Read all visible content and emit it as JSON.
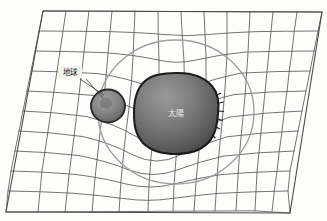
{
  "figure": {
    "background_color": "#fdfdfc",
    "labels": {
      "earth": "地球",
      "sun": "太陽"
    },
    "colors": {
      "grid_line": "#5a5a5a",
      "plane_edge": "#4a4a4a",
      "orbit_line": "#9a9a9a",
      "sun_fill": "#6f6f6f",
      "sun_outline": "#1c1c1c",
      "earth_fill": "#7d7d7d",
      "earth_outline": "#2a2a2a",
      "label_text": "#1d1d1d",
      "sun_label_text": "#efe9e2"
    },
    "grid": {
      "columns": 12,
      "rows": 10,
      "plane_corners": {
        "top_left": [
          43,
          11
        ],
        "top_right": [
          322,
          12
        ],
        "bottom_right": [
          290,
          213
        ],
        "bottom_left": [
          6,
          212
        ]
      }
    },
    "bodies": [
      {
        "name": "sun",
        "label": "太陽",
        "center": [
          176,
          113
        ],
        "radius_x": 42,
        "radius_y": 40
      },
      {
        "name": "earth",
        "label": "地球",
        "center": [
          108,
          106
        ],
        "radius_x": 17,
        "radius_y": 16
      }
    ],
    "orbit": {
      "name": "earth-orbit-ellipse",
      "center": [
        176,
        112
      ],
      "radius_x": 78,
      "radius_y": 72
    },
    "leader_line": {
      "from": [
        80,
        78
      ],
      "to": [
        104,
        94
      ]
    }
  }
}
